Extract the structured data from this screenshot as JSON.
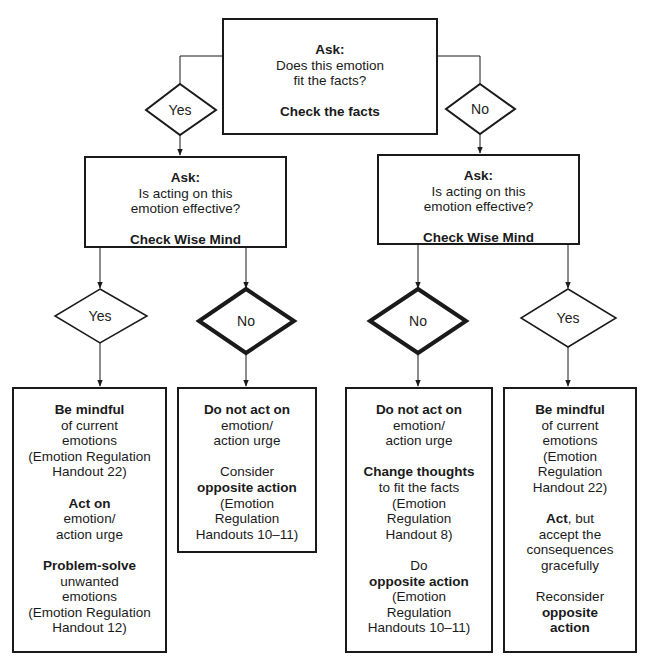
{
  "diagram": {
    "type": "flowchart",
    "root": {
      "ask_label": "Ask:",
      "question_line1": "Does this emotion",
      "question_line2": "fit the facts?",
      "action": "Check the facts"
    },
    "branches": {
      "yes_label": "Yes",
      "no_label": "No"
    },
    "left_wise": {
      "ask_label": "Ask:",
      "question_line1": "Is acting on this",
      "question_line2": "emotion effective?",
      "action": "Check Wise Mind"
    },
    "right_wise": {
      "ask_label": "Ask:",
      "question_line1": "Is acting on this",
      "question_line2": "emotion effective?",
      "action": "Check Wise Mind"
    },
    "level3": {
      "left_yes": "Yes",
      "left_no": "No",
      "right_no": "No",
      "right_yes": "Yes"
    },
    "outcomes": {
      "fits_effective": {
        "l1": "Be mindful",
        "l2": "of current",
        "l3": "emotions",
        "l4": "(Emotion Regulation",
        "l5": "Handout 22)",
        "l6": "Act on",
        "l7": "emotion/",
        "l8": "action urge",
        "l9": "Problem-solve",
        "l10": "unwanted",
        "l11": "emotions",
        "l12": "(Emotion Regulation",
        "l13": "Handout 12)"
      },
      "fits_not_effective": {
        "l1": "Do not act on",
        "l2": "emotion/",
        "l3": "action urge",
        "l4": "Consider",
        "l5": "opposite action",
        "l6": "(Emotion",
        "l7": "Regulation",
        "l8": "Handouts 10–11)"
      },
      "not_fit_not_effective": {
        "l1": "Do not act on",
        "l2": "emotion/",
        "l3": "action urge",
        "l4": "Change thoughts",
        "l5": "to fit the facts",
        "l6": "(Emotion",
        "l7": "Regulation",
        "l8": "Handout 8)",
        "l9": "Do",
        "l10": "opposite action",
        "l11": "(Emotion",
        "l12": "Regulation",
        "l13": "Handouts 10–11)"
      },
      "not_fit_effective": {
        "l1": "Be mindful",
        "l2": "of current",
        "l3": "emotions",
        "l4": "(Emotion",
        "l5": "Regulation",
        "l6": "Handout 22)",
        "l7a": "Act",
        "l7b": ", but",
        "l8": "accept the",
        "l9": "consequences",
        "l10": "gracefully",
        "l11": "Reconsider",
        "l12": "opposite",
        "l13": "action"
      }
    },
    "colors": {
      "line": "#1a1a1a",
      "background": "#ffffff"
    }
  }
}
